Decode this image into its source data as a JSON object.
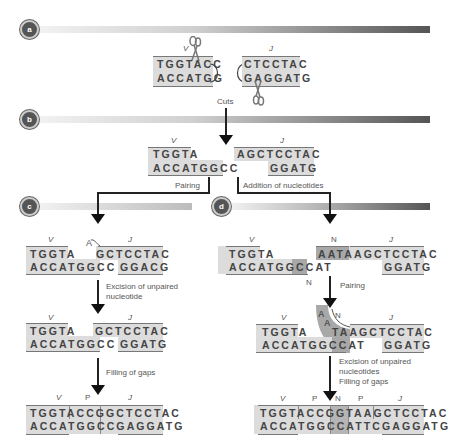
{
  "panels": {
    "a": {
      "badge": "a"
    },
    "b": {
      "badge": "b"
    },
    "c": {
      "badge": "c"
    },
    "d": {
      "badge": "d"
    }
  },
  "colors": {
    "box_light": "#dcdcdc",
    "box_dark": "#a8a8a8",
    "text": "#444444",
    "arrow": "#111111"
  },
  "step_a": {
    "v_label": "V",
    "j_label": "J",
    "v_top": "TGGTACC",
    "v_bottom": "ACCATGG",
    "j_top": "CTCCTAC",
    "j_bottom": "GAGGATG",
    "cuts_label": "Cuts"
  },
  "step_b": {
    "v_label": "V",
    "j_label": "J",
    "v_top": "TGGTA",
    "v_bottom": "ACCATGGCC",
    "j_top": "AGCTCCTAC",
    "j_bottom": "GGATG",
    "pairing_label": "Pairing",
    "addition_label": "Addition of nucleotides"
  },
  "step_c": {
    "row1": {
      "v_label": "V",
      "j_label": "J",
      "unpaired": "A",
      "v_top": "TGGTA",
      "v_bottom": "ACCATGGCC",
      "j_top": "GCTCCTAC",
      "j_bottom": "GGACG"
    },
    "excision_label_1": "Excision of unpaired",
    "excision_label_2": "nucleotide",
    "row2": {
      "v_label": "V",
      "j_label": "J",
      "v_top": "TGGTA",
      "v_bottom": "ACCATGGCC",
      "j_top": "GCTCCTAC",
      "j_bottom": "GGATG"
    },
    "filling_label": "Filling of gaps",
    "row3": {
      "v_label": "V",
      "p_label": "P",
      "j_label": "J",
      "top": "TGGTACCGGCTCCTAC",
      "bottom": "ACCATGGCCGAGGATG"
    }
  },
  "step_d": {
    "row1": {
      "v_label": "V",
      "n_label": "N",
      "j_label": "J",
      "n_bottom_label": "N",
      "v_top": "TGGTA",
      "v_bottom": "ACCATGGCC",
      "v_bottom_n": "AT",
      "n_top": "AATA",
      "j_top": "AGCTCCTAC",
      "j_bottom": "GGATG"
    },
    "pairing_label": "Pairing",
    "row2": {
      "v_label": "V",
      "n_label": "N",
      "j_label": "J",
      "loop_a1": "A",
      "loop_a2": "A",
      "v_top": "TGGTA",
      "v_bottom": "ACCATGGCC",
      "v_bottom_n": "AT",
      "n_top": "TA",
      "j_top": "AGCTCCTAC",
      "j_bottom": "GGATG"
    },
    "excision_label_1": "Excision of unpaired",
    "excision_label_2": "nucleotides",
    "filling_label": "Filling of gaps",
    "row3": {
      "v_label": "V",
      "p1_label": "P",
      "n_label": "N",
      "p2_label": "P",
      "j_label": "J",
      "top": "TGGTACCGGTAAGCTCCTAC",
      "bottom": "ACCATGGCCATTCGAGGATG"
    }
  }
}
